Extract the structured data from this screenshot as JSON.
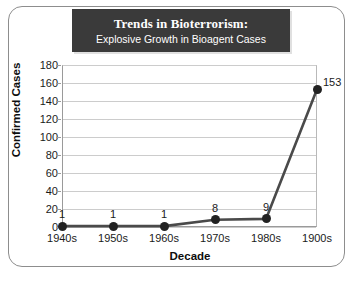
{
  "title": {
    "main": "Trends in Bioterrorism:",
    "sub": "Explosive Growth in Bioagent Cases"
  },
  "chart_data": {
    "type": "line",
    "title": "Trends in Bioterrorism: Explosive Growth in Bioagent Cases",
    "xlabel": "Decade",
    "ylabel": "Confirmed Cases",
    "categories": [
      "1940s",
      "1950s",
      "1960s",
      "1970s",
      "1980s",
      "1900s"
    ],
    "values": [
      1,
      1,
      1,
      8,
      9,
      153
    ],
    "point_labels": [
      "1",
      "1",
      "1",
      "8",
      "9",
      "153"
    ],
    "ylim": [
      0,
      180
    ],
    "yticks": [
      0,
      20,
      40,
      60,
      80,
      100,
      120,
      140,
      160,
      180
    ],
    "ytick_labels": [
      "0",
      "20",
      "40",
      "60",
      "80",
      "100",
      "120",
      "140",
      "160",
      "180"
    ],
    "grid": true,
    "legend": false,
    "series": [
      {
        "name": "Confirmed Cases",
        "values": [
          1,
          1,
          1,
          8,
          9,
          153
        ],
        "marker": "filled-circle",
        "line_color": "#4a4a4a",
        "marker_color": "#222222"
      }
    ]
  },
  "colors": {
    "title_background": "#3a3a3a",
    "title_text": "#ffffff",
    "line": "#4a4a4a",
    "marker": "#222222",
    "gridline": "#cccccc",
    "axis": "#9a9a9a",
    "frame_border": "#8d8d8d",
    "background": "#ffffff"
  }
}
